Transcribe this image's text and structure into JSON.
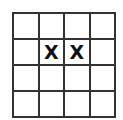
{
  "grid": {
    "rows": 4,
    "cols": 4,
    "cells": [
      [
        "",
        "",
        "",
        ""
      ],
      [
        "",
        "X",
        "X",
        ""
      ],
      [
        "",
        "",
        "",
        ""
      ],
      [
        "",
        "",
        "",
        ""
      ]
    ]
  }
}
